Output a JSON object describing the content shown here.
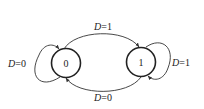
{
  "diagram": {
    "type": "state-diagram",
    "states": [
      {
        "id": "s0",
        "label": "0"
      },
      {
        "id": "s1",
        "label": "1"
      }
    ],
    "transitions": [
      {
        "from": "0",
        "to": "1",
        "var": "D",
        "value": "1",
        "label": "D=1"
      },
      {
        "from": "1",
        "to": "0",
        "var": "D",
        "value": "0",
        "label": "D=0"
      },
      {
        "from": "0",
        "to": "0",
        "var": "D",
        "value": "0",
        "label": "D=0"
      },
      {
        "from": "1",
        "to": "1",
        "var": "D",
        "value": "1",
        "label": "D=1"
      }
    ],
    "colors": {
      "stroke": "#333333",
      "text": "#222222",
      "background": "#ffffff"
    }
  }
}
